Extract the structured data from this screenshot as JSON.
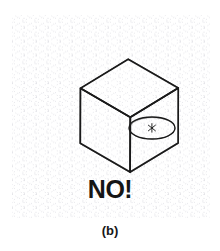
{
  "figure": {
    "caption": "(b)",
    "verdict_label": "NO!",
    "verdict_color": "#151515",
    "caption_color": "#171717",
    "background_color": "#ffffff",
    "ink_color": "#1a1a1a",
    "grid_color": "#d8d8de"
  },
  "grid": {
    "name": "isometric-dot-grid",
    "left": 12,
    "top": 15,
    "right": 210,
    "bottom": 218,
    "spacing": 12,
    "dash_pattern": "1 3",
    "directions": [
      "vertical",
      "+30deg",
      "-30deg"
    ],
    "color": "#d8d8de"
  },
  "cube": {
    "name": "isometric-cube",
    "stroke_color": "#1a1a1a",
    "stroke_width": 1.6,
    "vertices": {
      "top_apex": [
        128,
        59
      ],
      "upper_left": [
        80,
        88
      ],
      "upper_right": [
        178,
        88
      ],
      "center_front": [
        130,
        117
      ],
      "lower_left": [
        80,
        143
      ],
      "bottom": [
        130,
        172
      ],
      "lower_right": [
        178,
        143
      ]
    },
    "faces": [
      "top",
      "left",
      "right"
    ]
  },
  "ellipse": {
    "name": "incorrect-circle-on-right-face",
    "center": [
      152,
      128
    ],
    "radius_x": 23,
    "radius_y": 11,
    "rotation_deg": 0,
    "stroke_color": "#1a1a1a",
    "stroke_width": 1.3,
    "center_mark": "cross-tick"
  }
}
